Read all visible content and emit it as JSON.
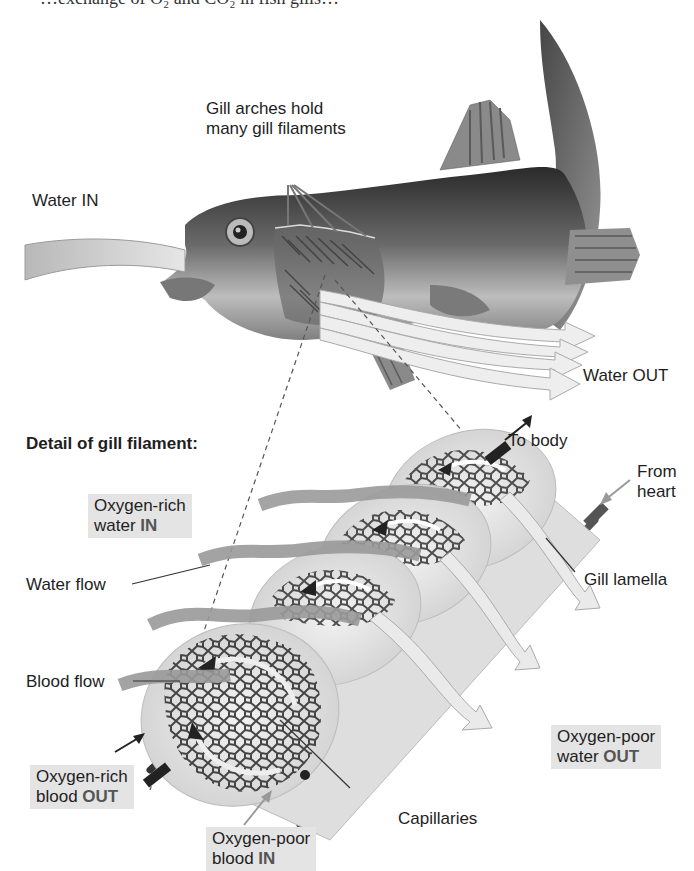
{
  "caption_partial": "…exchange of O₂ and CO₂ in fish gills…",
  "labels": {
    "gill_arches": "Gill arches hold\nmany gill filaments",
    "gill_arches_line1": "Gill arches hold",
    "gill_arches_line2": "many gill filaments",
    "water_in": "Water IN",
    "water_out": "Water OUT",
    "detail_heading": "Detail of gill filament:",
    "to_body": "To body",
    "from_heart_line1": "From",
    "from_heart_line2": "heart",
    "oxygen_rich_water_line1": "Oxygen-rich",
    "oxygen_rich_water_line2_prefix": "water ",
    "oxygen_rich_water_line2_bold": "IN",
    "water_flow": "Water flow",
    "gill_lamella": "Gill lamella",
    "blood_flow": "Blood flow",
    "oxygen_poor_water_line1": "Oxygen-poor",
    "oxygen_poor_water_line2_prefix": "water ",
    "oxygen_poor_water_line2_bold": "OUT",
    "oxygen_rich_blood_line1": "Oxygen-rich",
    "oxygen_rich_blood_line2_prefix": "blood ",
    "oxygen_rich_blood_line2_bold": "OUT",
    "capillaries": "Capillaries",
    "oxygen_poor_blood_line1": "Oxygen-poor",
    "oxygen_poor_blood_line2_prefix": "blood ",
    "oxygen_poor_blood_line2_bold": "IN"
  },
  "colors": {
    "label_box_bg": "#e4e4e4",
    "water_arrow": "#9a9a9a",
    "fish_dark": "#2e2e2e",
    "lamella": "#ececec",
    "capillary": "#3a3a3a"
  }
}
